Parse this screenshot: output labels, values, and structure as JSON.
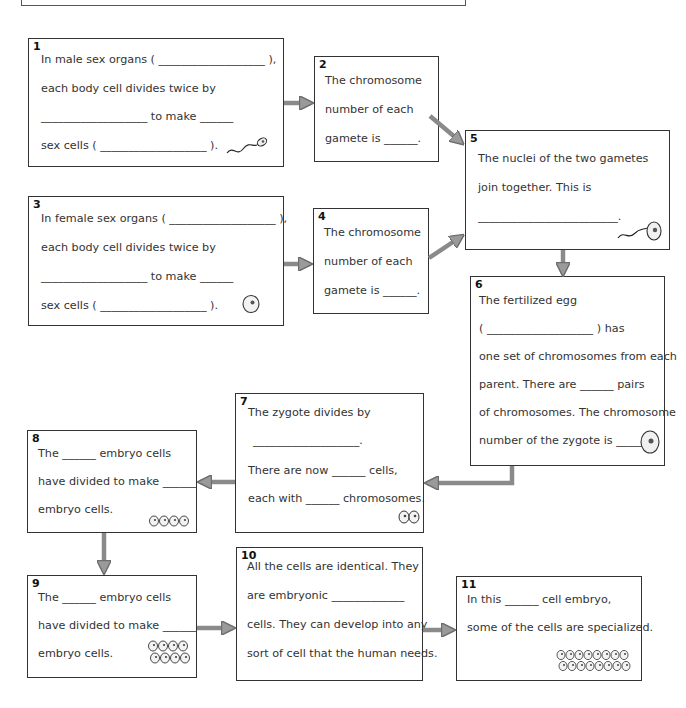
{
  "worksheet": {
    "steps": [
      {
        "id": "1",
        "lines": [
          "In male sex organs ( ___________________ ),",
          "each body cell divides twice by",
          "___________________ to make ______",
          "sex cells ( ___________________ )."
        ],
        "icon": "sperm-icon"
      },
      {
        "id": "2",
        "lines": [
          "The chromosome",
          "number of each",
          "gamete is ______."
        ]
      },
      {
        "id": "3",
        "lines": [
          "In female sex organs ( ___________________ ),",
          "each body cell divides twice by",
          "___________________ to make ______",
          "sex cells ( ___________________ )."
        ],
        "icon": "egg-cell-icon"
      },
      {
        "id": "4",
        "lines": [
          "The chromosome",
          "number of each",
          "gamete is ______."
        ]
      },
      {
        "id": "5",
        "lines": [
          "The nuclei of the two gametes",
          "join together. This is",
          "_________________________."
        ],
        "icon": "fertilization-icon"
      },
      {
        "id": "6",
        "lines": [
          "The fertilized egg",
          "( ___________________ ) has",
          "one set of chromosomes from each",
          "parent. There are ______ pairs",
          "of chromosomes. The chromosome",
          "number of the zygote is ______."
        ],
        "icon": "zygote-icon"
      },
      {
        "id": "7",
        "lines": [
          "The zygote divides by",
          "___________________.",
          "There are now ______ cells,",
          "each with ______ chromosomes."
        ],
        "icon": "two-cells-icon"
      },
      {
        "id": "8",
        "lines": [
          "The ______ embryo cells",
          "have divided to make ______",
          "embryo cells."
        ],
        "icon": "four-cells-icon"
      },
      {
        "id": "9",
        "lines": [
          "The ______ embryo cells",
          "have divided to make ______",
          "embryo cells."
        ],
        "icon": "eight-cells-icon"
      },
      {
        "id": "10",
        "lines": [
          "All the cells are identical. They",
          "are embryonic _____________",
          "cells. They can develop into any",
          "sort of cell that the human needs."
        ]
      },
      {
        "id": "11",
        "lines": [
          "In this ______ cell embryo,",
          "some of the cells are specialized."
        ],
        "icon": "sixteen-cells-icon"
      }
    ]
  },
  "colors": {
    "border": "#333333",
    "arrow_fill": "#9a9a9a",
    "arrow_stroke": "#6e6e6e",
    "text": "#333333"
  }
}
